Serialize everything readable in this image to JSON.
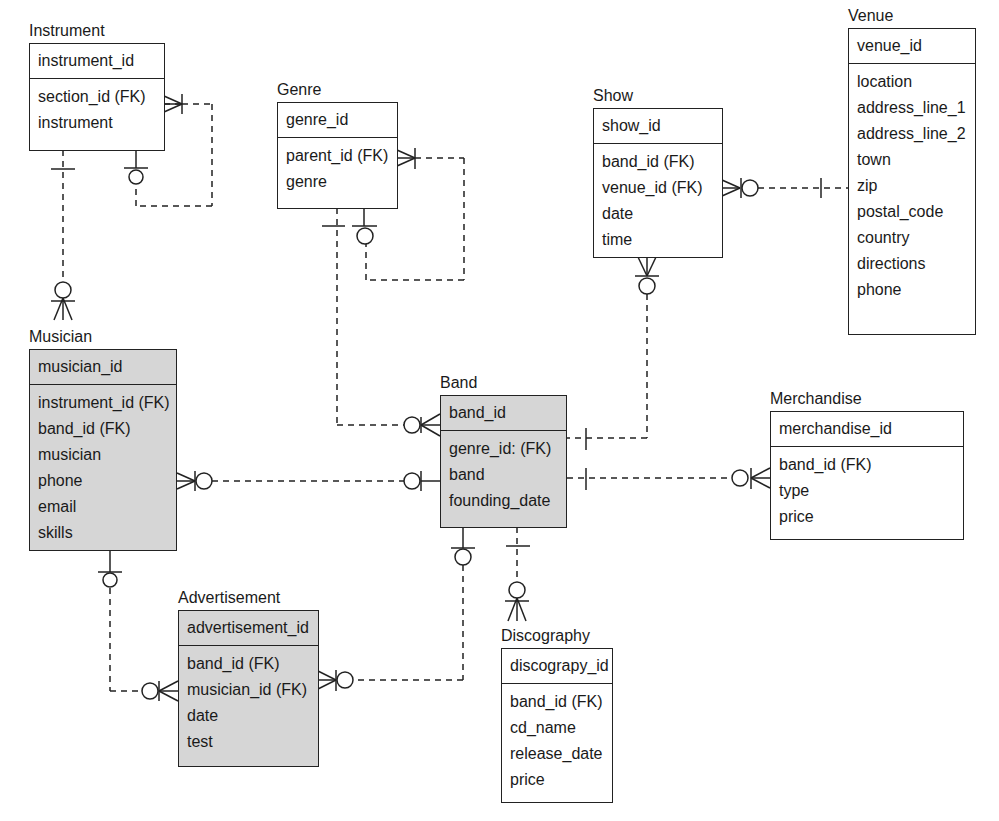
{
  "entities": {
    "instrument": {
      "title": "Instrument",
      "pk": "instrument_id",
      "attrs": [
        "section_id (FK)",
        "instrument"
      ],
      "shaded": false
    },
    "genre": {
      "title": "Genre",
      "pk": "genre_id",
      "attrs": [
        "parent_id (FK)",
        "genre"
      ],
      "shaded": false
    },
    "show": {
      "title": "Show",
      "pk": "show_id",
      "attrs": [
        "band_id (FK)",
        "venue_id (FK)",
        "date",
        "time"
      ],
      "shaded": false
    },
    "venue": {
      "title": "Venue",
      "pk": "venue_id",
      "attrs": [
        "location",
        "address_line_1",
        "address_line_2",
        "town",
        "zip",
        "postal_code",
        "country",
        "directions",
        "phone"
      ],
      "shaded": false
    },
    "musician": {
      "title": "Musician",
      "pk": "musician_id",
      "attrs": [
        "instrument_id (FK)",
        "band_id (FK)",
        "musician",
        "phone",
        "email",
        "skills"
      ],
      "shaded": true
    },
    "band": {
      "title": "Band",
      "pk": "band_id",
      "attrs": [
        "genre_id: (FK)",
        "band",
        "founding_date"
      ],
      "shaded": true
    },
    "merchandise": {
      "title": "Merchandise",
      "pk": "merchandise_id",
      "attrs": [
        "band_id (FK)",
        "type",
        "price"
      ],
      "shaded": false
    },
    "advertisement": {
      "title": "Advertisement",
      "pk": "advertisement_id",
      "attrs": [
        "band_id (FK)",
        "musician_id (FK)",
        "date",
        "test"
      ],
      "shaded": true
    },
    "discography": {
      "title": "Discography",
      "pk": "discograpy_id",
      "attrs": [
        "band_id (FK)",
        "cd_name",
        "release_date",
        "price"
      ],
      "shaded": false
    }
  },
  "relationships": [
    {
      "from": "Instrument",
      "to": "Instrument",
      "type": "self-reference zero-or-one to one-or-many"
    },
    {
      "from": "Instrument",
      "to": "Musician",
      "type": "one to zero-or-many"
    },
    {
      "from": "Genre",
      "to": "Genre",
      "type": "self-reference zero-or-one to one-or-many"
    },
    {
      "from": "Genre",
      "to": "Band",
      "type": "one to zero-or-many"
    },
    {
      "from": "Show",
      "to": "Venue",
      "type": "zero-or-many to one"
    },
    {
      "from": "Show",
      "to": "Band",
      "type": "zero-or-many to one"
    },
    {
      "from": "Musician",
      "to": "Band",
      "type": "zero-or-many to zero-or-one"
    },
    {
      "from": "Band",
      "to": "Merchandise",
      "type": "one to zero-or-many"
    },
    {
      "from": "Musician",
      "to": "Advertisement",
      "type": "zero-or-one to zero-or-many"
    },
    {
      "from": "Band",
      "to": "Advertisement",
      "type": "zero-or-one to zero-or-many"
    },
    {
      "from": "Band",
      "to": "Discography",
      "type": "one to zero-or-many"
    }
  ],
  "colors": {
    "line": "#222222",
    "shaded_fill": "#d6d6d6",
    "background": "#ffffff"
  }
}
